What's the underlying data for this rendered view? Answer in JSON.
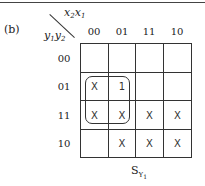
{
  "figure_label": "(b)",
  "col_var": {
    "base": "x",
    "first_sub": "2",
    "second": "x",
    "second_sub": "1"
  },
  "row_var": {
    "base": "y",
    "first_sub": "1",
    "second": "y",
    "second_sub": "2"
  },
  "col_headers": [
    "00",
    "01",
    "11",
    "10"
  ],
  "row_headers": [
    "00",
    "01",
    "11",
    "10"
  ],
  "cells": [
    [
      "",
      "",
      "",
      ""
    ],
    [
      "X",
      "1",
      "",
      ""
    ],
    [
      "X",
      "X",
      "X",
      "X"
    ],
    [
      "",
      "X",
      "X",
      "X"
    ]
  ],
  "grouping": {
    "rows": [
      "01",
      "11"
    ],
    "cols": [
      "00",
      "01"
    ]
  },
  "caption": {
    "base": "S",
    "sub": "Y",
    "subsub": "1"
  }
}
